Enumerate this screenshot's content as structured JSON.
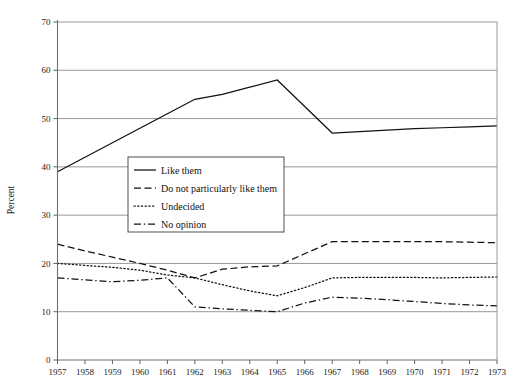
{
  "chart_data": {
    "type": "line",
    "title": "",
    "xlabel": "",
    "ylabel": "Percent",
    "xlim": [
      1957,
      1973
    ],
    "ylim": [
      0,
      70
    ],
    "ytick_step": 10,
    "yticks": [
      0,
      10,
      20,
      30,
      40,
      50,
      60,
      70
    ],
    "grid": true,
    "legend_position": "center-left",
    "x": [
      1957,
      1958,
      1959,
      1960,
      1961,
      1962,
      1963,
      1964,
      1965,
      1966,
      1967,
      1968,
      1969,
      1970,
      1971,
      1972,
      1973
    ],
    "categories": [
      "1957",
      "1958",
      "1959",
      "1960",
      "1961",
      "1962",
      "1963",
      "1964",
      "1965",
      "1966",
      "1967",
      "1968",
      "1969",
      "1970",
      "1971",
      "1972",
      "1973"
    ],
    "series": [
      {
        "name": "Like them",
        "style": "solid",
        "color": "#111111",
        "values": [
          39,
          42,
          45,
          48,
          51,
          54,
          55,
          56.5,
          58,
          52.5,
          47,
          47.3,
          47.6,
          47.9,
          48.1,
          48.3,
          48.5
        ]
      },
      {
        "name": "Do not particularly like them",
        "style": "dashed",
        "color": "#111111",
        "values": [
          24,
          22.6,
          21.3,
          20,
          18.6,
          17,
          18.8,
          19.3,
          19.5,
          22,
          24.5,
          24.5,
          24.5,
          24.5,
          24.5,
          24.4,
          24.3
        ]
      },
      {
        "name": "Undecided",
        "style": "dotted",
        "color": "#111111",
        "values": [
          20,
          19.6,
          19.2,
          18.6,
          17.6,
          17,
          15.6,
          14.3,
          13.3,
          15,
          17,
          17.1,
          17.1,
          17.1,
          17,
          17.1,
          17.2
        ]
      },
      {
        "name": "No opinion",
        "style": "dashdot",
        "color": "#111111",
        "values": [
          17,
          16.6,
          16.2,
          16.5,
          17,
          11,
          10.6,
          10.3,
          10,
          11.8,
          13,
          12.8,
          12.5,
          12.1,
          11.7,
          11.4,
          11.2
        ]
      }
    ]
  }
}
